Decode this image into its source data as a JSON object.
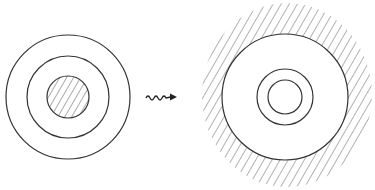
{
  "diagram": {
    "stroke_color": "#333333",
    "hatch_color": "#444444",
    "background": "#ffffff",
    "left_figure": {
      "center": [
        68,
        97
      ],
      "outer_radius": 62,
      "middle_radius": 41,
      "inner_radius": 21,
      "inner_hatched": true
    },
    "arrow": {
      "type": "wavy-arrow",
      "from": [
        146,
        97
      ],
      "to": [
        177,
        97
      ]
    },
    "right_figure": {
      "center": [
        285,
        97
      ],
      "outer_radius": 63,
      "middle_radius": 28,
      "inner_radius": 17,
      "outside_hatched": true,
      "hatch_region": {
        "cx": 287,
        "cy": 95,
        "rx": 85,
        "ry": 92
      }
    }
  }
}
